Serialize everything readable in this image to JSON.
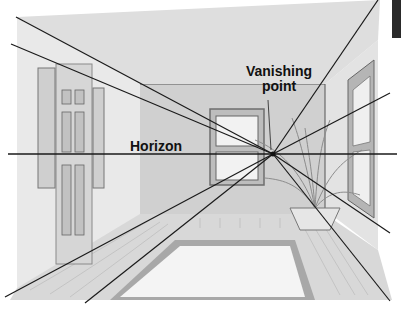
{
  "diagram": {
    "labels": {
      "horizon": "Horizon",
      "vanishing_point_line1": "Vanishing",
      "vanishing_point_line2": "point"
    },
    "vanishing_point": {
      "x": 273,
      "y": 154
    },
    "horizon_line": {
      "y": 154,
      "x_start": 8,
      "x_end": 397
    },
    "perspective_lines": [
      {
        "from": [
          16,
          17
        ],
        "to": [
          273,
          154
        ]
      },
      {
        "from": [
          11,
          44
        ],
        "to": [
          273,
          154
        ]
      },
      {
        "from": [
          5,
          297
        ],
        "to": [
          273,
          154
        ]
      },
      {
        "from": [
          85,
          303
        ],
        "to": [
          273,
          154
        ]
      },
      {
        "from": [
          378,
          0
        ],
        "to": [
          273,
          154
        ]
      },
      {
        "from": [
          390,
          93
        ],
        "to": [
          273,
          154
        ]
      },
      {
        "from": [
          390,
          233
        ],
        "to": [
          273,
          154
        ]
      },
      {
        "from": [
          390,
          301
        ],
        "to": [
          273,
          154
        ]
      }
    ],
    "colors": {
      "line": "#1a1a1a",
      "wall_light": "#e6e6e6",
      "wall_back": "#cfcfcf",
      "floor": "#d9d9d9",
      "rug": "#f4f4f4",
      "rug_border": "#a9a9a9",
      "frame": "#9a9a9a"
    }
  }
}
